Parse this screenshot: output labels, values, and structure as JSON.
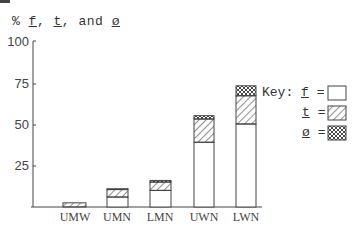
{
  "title": {
    "prefix": "% ",
    "f": "f",
    "sep1": ", ",
    "t": "t",
    "sep2": ", and ",
    "phi": "ø"
  },
  "axis": {
    "y_ticks": [
      "100",
      "75",
      "50",
      "25"
    ]
  },
  "key": {
    "label": "Key:",
    "items": [
      {
        "symbol": "f",
        "eq": "=",
        "pattern": "blank"
      },
      {
        "symbol": "t",
        "eq": "=",
        "pattern": "diagonal-hatch"
      },
      {
        "symbol": "ø",
        "eq": "=",
        "pattern": "cross-hatch"
      }
    ]
  },
  "categories": [
    "UMW",
    "UMN",
    "LMN",
    "UWN",
    "LWN"
  ],
  "chart_data": {
    "type": "bar",
    "stacked": true,
    "title": "% f, t, and ø",
    "xlabel": "",
    "ylabel": "%",
    "ylim": [
      0,
      100
    ],
    "y_ticks": [
      25,
      50,
      75,
      100
    ],
    "grid": false,
    "legend_position": "right",
    "categories": [
      "UMW",
      "UMN",
      "LMN",
      "UWN",
      "LWN"
    ],
    "series": [
      {
        "name": "f",
        "pattern": "blank",
        "values": [
          0,
          6,
          10,
          39,
          50
        ]
      },
      {
        "name": "t",
        "pattern": "diagonal-hatch",
        "values": [
          2.5,
          4.5,
          5,
          14,
          17
        ]
      },
      {
        "name": "ø",
        "pattern": "cross-hatch",
        "values": [
          0,
          0.5,
          1,
          2,
          6
        ]
      }
    ]
  }
}
